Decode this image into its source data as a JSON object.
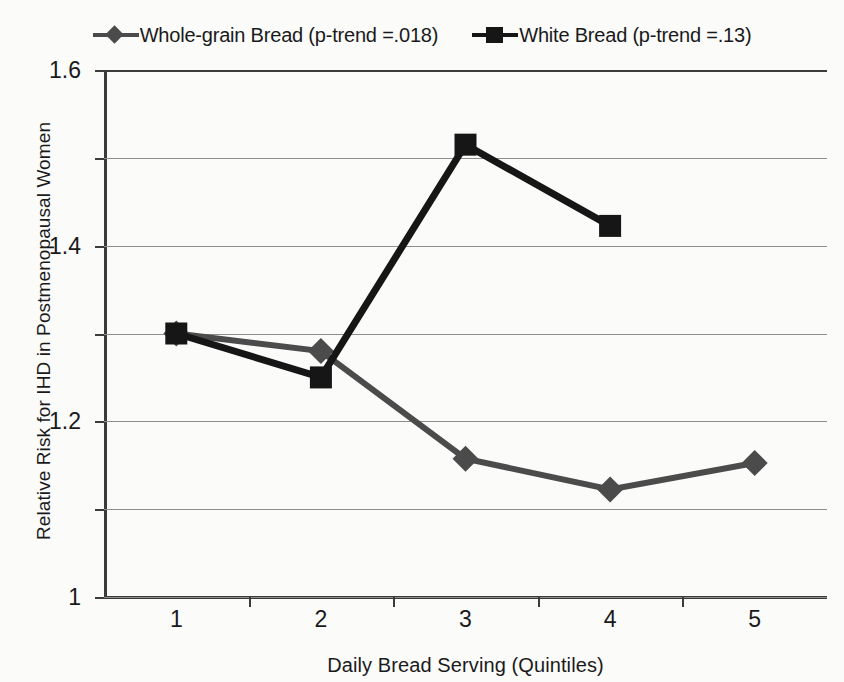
{
  "chart_data": {
    "type": "line",
    "title": "",
    "xlabel": "Daily Bread Serving (Quintiles)",
    "ylabel": "Relative Risk  for IHD in Postmenopausal  Women",
    "categories": [
      "1",
      "2",
      "3",
      "4",
      "5"
    ],
    "yticks": [
      "1.6",
      "1.4",
      "1.2",
      "1",
      "0.8",
      "0.6",
      "0.4"
    ],
    "ytick_values": [
      1.6,
      1.4,
      1.2,
      1.0,
      0.8,
      0.6,
      0.4
    ],
    "ylim": [
      0.4,
      1.6
    ],
    "grid": true,
    "legend_position": "top-center",
    "series": [
      {
        "name": "Whole-grain Bread (p-trend =.018)",
        "marker": "diamond",
        "color": "#4b4b4b",
        "values": [
          1.0,
          0.96,
          0.715,
          0.645,
          0.705
        ]
      },
      {
        "name": "White Bread (p-trend =.13)",
        "marker": "square",
        "color": "#161616",
        "values": [
          1.0,
          0.9,
          1.43,
          1.245,
          null
        ]
      }
    ]
  },
  "legend": {
    "entries": [
      {
        "label": "Whole-grain Bread (p-trend =.018)",
        "marker": "diamond-marker",
        "color": "#4b4b4b"
      },
      {
        "label": "White Bread (p-trend =.13)",
        "marker": "square-marker",
        "color": "#161616"
      }
    ]
  },
  "colors": {
    "background": "#fbfbfa",
    "axis": "#3b3b3b",
    "grid": "#8e8e8e",
    "whole_grain": "#4b4b4b",
    "white_bread": "#161616"
  }
}
